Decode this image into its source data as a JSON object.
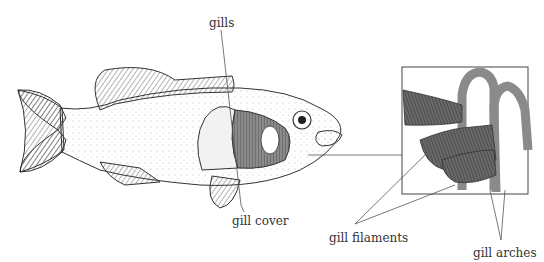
{
  "diagram": {
    "labels": {
      "gills": "gills",
      "gill_cover": "gill cover",
      "gill_filaments": "gill filaments",
      "gill_arches": "gill arches"
    },
    "colors": {
      "ink": "#333333",
      "filament": "#5a5a5a",
      "arch": "#8a8a8a",
      "leader": "#555555"
    }
  }
}
